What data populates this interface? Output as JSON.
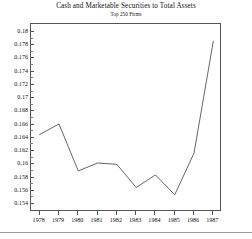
{
  "chart_data": {
    "type": "line",
    "title": "Cash and Marketable Securities to Total Assets",
    "subtitle": "Top 250 Firms",
    "xlabel": "",
    "ylabel": "",
    "grid": false,
    "legend": false,
    "categories": [
      "1978",
      "1979",
      "1980",
      "1981",
      "1982",
      "1983",
      "1984",
      "1985",
      "1986",
      "1987"
    ],
    "x": [
      1978,
      1979,
      1980,
      1981,
      1982,
      1983,
      1984,
      1985,
      1986,
      1987
    ],
    "values": [
      0.1645,
      0.1661,
      0.159,
      0.1602,
      0.16,
      0.1565,
      0.1584,
      0.1554,
      0.1617,
      0.1786
    ],
    "xlim": [
      1977.55,
      1987.45
    ],
    "ylim": [
      0.1528,
      0.1812
    ],
    "ytick_labels": [
      "0.18",
      "0.178",
      "0.176",
      "0.174",
      "0.172",
      "0.17",
      "0.168",
      "0.166",
      "0.164",
      "0.162",
      "0.16",
      "0.158",
      "0.156",
      "0.154"
    ],
    "ytick_values": [
      0.18,
      0.178,
      0.176,
      0.174,
      0.172,
      0.17,
      0.168,
      0.166,
      0.164,
      0.162,
      0.16,
      0.158,
      0.156,
      0.154
    ],
    "line_color": "#555555"
  }
}
